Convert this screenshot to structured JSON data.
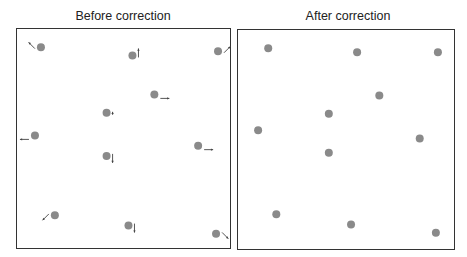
{
  "panels": [
    {
      "title": "Before correction",
      "dot_color": "#8a8a8a",
      "arrow_color": "#444444",
      "points": [
        {
          "x": 0.08,
          "y": 0.05,
          "arrow": "up-left"
        },
        {
          "x": 0.54,
          "y": 0.09,
          "arrow": "up"
        },
        {
          "x": 0.97,
          "y": 0.07,
          "arrow": "up-right"
        },
        {
          "x": 0.65,
          "y": 0.28,
          "arrow": "right"
        },
        {
          "x": 0.41,
          "y": 0.37,
          "arrow": "up-small"
        },
        {
          "x": 0.05,
          "y": 0.48,
          "arrow": "left"
        },
        {
          "x": 0.87,
          "y": 0.53,
          "arrow": "right"
        },
        {
          "x": 0.41,
          "y": 0.58,
          "arrow": "down"
        },
        {
          "x": 0.15,
          "y": 0.87,
          "arrow": "down-left"
        },
        {
          "x": 0.52,
          "y": 0.92,
          "arrow": "down"
        },
        {
          "x": 0.96,
          "y": 0.96,
          "arrow": "down-right"
        }
      ]
    },
    {
      "title": "After correction",
      "dot_color": "#8a8a8a",
      "points": [
        {
          "x": 0.11,
          "y": 0.05
        },
        {
          "x": 0.55,
          "y": 0.07
        },
        {
          "x": 0.95,
          "y": 0.07
        },
        {
          "x": 0.66,
          "y": 0.28
        },
        {
          "x": 0.41,
          "y": 0.37
        },
        {
          "x": 0.06,
          "y": 0.45
        },
        {
          "x": 0.86,
          "y": 0.49
        },
        {
          "x": 0.41,
          "y": 0.56
        },
        {
          "x": 0.15,
          "y": 0.86
        },
        {
          "x": 0.52,
          "y": 0.91
        },
        {
          "x": 0.94,
          "y": 0.95
        }
      ]
    }
  ]
}
